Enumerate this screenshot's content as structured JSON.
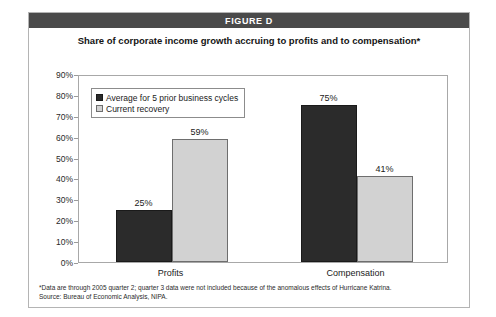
{
  "figure": {
    "header_label": "FIGURE D",
    "subtitle": "Share of corporate income growth accruing to profits and to compensation*"
  },
  "legend": {
    "items": [
      {
        "label": "Average for 5 prior business cycles",
        "swatch": "series-dark"
      },
      {
        "label": "Current recovery",
        "swatch": "series-light"
      }
    ]
  },
  "footnotes": {
    "line1": "*Data are through 2005 quarter 2; quarter 3 data were not included because of the anomalous effects of Hurricane Katrina.",
    "line2": "Source: Bureau of Economic Analysis, NIPA."
  },
  "colors": {
    "header_bar": "#4a4a4a",
    "series_dark": "#2b2b2b",
    "series_light": "#d2d2d2",
    "axis_line": "#a8a8a8"
  },
  "chart_data": {
    "type": "bar",
    "title": "FIGURE D",
    "subtitle": "Share of corporate income growth accruing to profits and to compensation*",
    "xlabel": "",
    "ylabel": "",
    "categories": [
      "Profits",
      "Compensation"
    ],
    "series": [
      {
        "name": "Average for 5 prior business cycles",
        "color": "#2b2b2b",
        "values": [
          25,
          75
        ],
        "value_labels": [
          "25%",
          "75%"
        ]
      },
      {
        "name": "Current recovery",
        "color": "#d2d2d2",
        "values": [
          59,
          41
        ],
        "value_labels": [
          "59%",
          "41%"
        ]
      }
    ],
    "ylim": [
      0,
      90
    ],
    "ytick_values": [
      0,
      10,
      20,
      30,
      40,
      50,
      60,
      70,
      80,
      90
    ],
    "ytick_labels": [
      "0%",
      "10%",
      "20%",
      "30%",
      "40%",
      "50%",
      "60%",
      "70%",
      "80%",
      "90%"
    ],
    "grid": false,
    "legend_position": "upper-left-inside"
  }
}
